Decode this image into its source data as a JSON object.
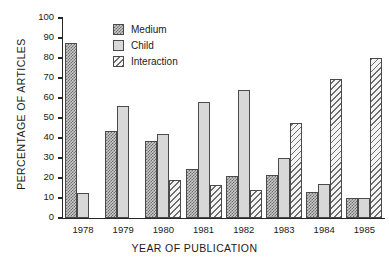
{
  "chart_data": {
    "type": "bar",
    "title": "",
    "xlabel": "YEAR OF PUBLICATION",
    "ylabel": "PERCENTAGE OF ARTICLES",
    "categories": [
      "1978",
      "1979",
      "1980",
      "1981",
      "1982",
      "1983",
      "1984",
      "1985"
    ],
    "series": [
      {
        "name": "Medium",
        "values": [
          87.5,
          43.5,
          38.5,
          24.5,
          21.0,
          21.5,
          13.0,
          10.0
        ]
      },
      {
        "name": "Child",
        "values": [
          12.5,
          56.0,
          42.0,
          58.0,
          64.0,
          30.0,
          17.0,
          10.0
        ]
      },
      {
        "name": "Interaction",
        "values": [
          0,
          0,
          19.0,
          16.5,
          14.0,
          47.5,
          69.5,
          80.0
        ]
      }
    ],
    "ylim": [
      0,
      100
    ],
    "yticks": [
      "0",
      "10",
      "20",
      "30",
      "40",
      "50",
      "60",
      "70",
      "80",
      "90",
      "100"
    ],
    "grid": false,
    "legend_position": "upper-center-left",
    "legend": [
      "Medium",
      "Child",
      "Interaction"
    ],
    "colors": {
      "medium": "#6e6e6e",
      "child": "#d8d8d8",
      "interaction": "#6e6e6e",
      "axis": "#262626"
    }
  }
}
